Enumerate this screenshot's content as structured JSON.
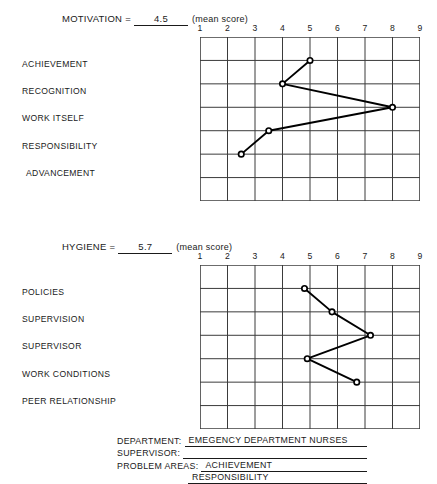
{
  "sections": [
    {
      "id": "motivation",
      "header": {
        "label": "MOTIVATION",
        "equals": "=",
        "value": "4.5",
        "unit": "(mean score)"
      },
      "axis_ticks": [
        "1",
        "2",
        "3",
        "4",
        "5",
        "6",
        "7",
        "8",
        "9"
      ],
      "rows": [
        "ACHIEVEMENT",
        "RECOGNITION",
        "WORK ITSELF",
        "RESPONSIBILITY",
        "ADVANCEMENT"
      ],
      "values": [
        5.0,
        4.0,
        8.0,
        3.5,
        2.5
      ]
    },
    {
      "id": "hygiene",
      "header": {
        "label": "HYGIENE",
        "equals": "=",
        "value": "5.7",
        "unit": "(mean score)"
      },
      "axis_ticks": [
        "1",
        "2",
        "3",
        "4",
        "5",
        "6",
        "7",
        "8",
        "9"
      ],
      "rows": [
        "POLICIES",
        "SUPERVISION",
        "SUPERVISOR",
        "WORK CONDITIONS",
        "PEER RELATIONSHIP"
      ],
      "values": [
        4.8,
        5.8,
        7.2,
        4.9,
        6.7
      ]
    }
  ],
  "form": {
    "department_label": "DEPARTMENT:",
    "department_value": "EMEGENCY DEPARTMENT NURSES",
    "supervisor_label": "SUPERVISOR:",
    "supervisor_value": "",
    "problem_areas_label": "PROBLEM AREAS:",
    "problem_area_1": "ACHIEVEMENT",
    "problem_area_2": "RESPONSIBILITY"
  },
  "chart_data": [
    {
      "type": "line",
      "title": "MOTIVATION = 4.5 (mean score)",
      "xlabel": "",
      "ylabel": "",
      "xlim": [
        1,
        9
      ],
      "grid": true,
      "legend": "none",
      "orientation": "horizontal-categories",
      "categories": [
        "ACHIEVEMENT",
        "RECOGNITION",
        "WORK ITSELF",
        "RESPONSIBILITY",
        "ADVANCEMENT"
      ],
      "values": [
        5.0,
        4.0,
        8.0,
        3.5,
        2.5
      ],
      "tick_labels": [
        "1",
        "2",
        "3",
        "4",
        "5",
        "6",
        "7",
        "8",
        "9"
      ],
      "mean_score": 4.5,
      "markers": "open-circle"
    },
    {
      "type": "line",
      "title": "HYGIENE = 5.7 (mean score)",
      "xlabel": "",
      "ylabel": "",
      "xlim": [
        1,
        9
      ],
      "grid": true,
      "legend": "none",
      "orientation": "horizontal-categories",
      "categories": [
        "POLICIES",
        "SUPERVISION",
        "SUPERVISOR",
        "WORK CONDITIONS",
        "PEER RELATIONSHIP"
      ],
      "values": [
        4.8,
        5.8,
        7.2,
        4.9,
        6.7
      ],
      "tick_labels": [
        "1",
        "2",
        "3",
        "4",
        "5",
        "6",
        "7",
        "8",
        "9"
      ],
      "mean_score": 5.7,
      "markers": "open-circle"
    }
  ]
}
